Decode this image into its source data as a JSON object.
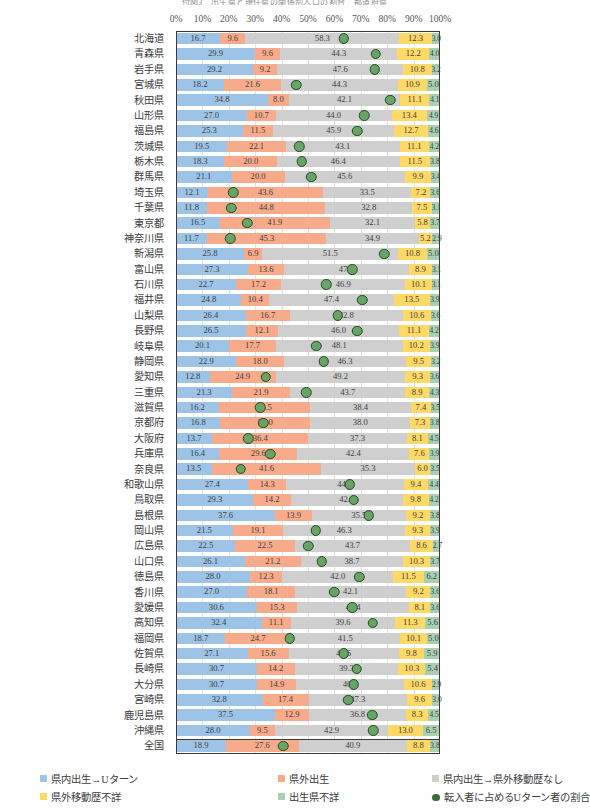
{
  "title": "付図3　出生県と現住県の関係別人口の割合　都道府県",
  "axis": {
    "ticks": [
      "0%",
      "10%",
      "20%",
      "30%",
      "40%",
      "50%",
      "60%",
      "70%",
      "80%",
      "90%",
      "100%"
    ],
    "min": 0,
    "max": 100
  },
  "legend": {
    "items": [
      {
        "label": "県内出生→Uターン",
        "color": "#9dc3e6",
        "marker": "square"
      },
      {
        "label": "県外出生",
        "color": "#f8ab8a",
        "marker": "square"
      },
      {
        "label": "県内出生→県外移動歴なし",
        "color": "#cfcfcf",
        "marker": "square"
      },
      {
        "label": "県外移動歴不詳",
        "color": "#ffd966",
        "marker": "square"
      },
      {
        "label": "出生県不詳",
        "color": "#a9d0b0",
        "marker": "square"
      },
      {
        "label": "転入者に占めるUターン者の割合",
        "color": "#3d6b3d",
        "marker": "circle"
      }
    ]
  },
  "series_colors": {
    "uturn": "#9dc3e6",
    "outside_born": "#f8ab8a",
    "no_move": "#cfcfcf",
    "move_unknown": "#ffd966",
    "birth_unknown": "#a9d0b0",
    "dot": "#6aa368",
    "dot_border": "#1f4d1f"
  },
  "chart_data": {
    "type": "bar",
    "orientation": "horizontal",
    "stacked": true,
    "normalized_percent": true,
    "title": "付図3　出生県と現住県の関係別人口の割合　都道府県",
    "xlabel": "",
    "ylabel": "",
    "xlim": [
      0,
      100
    ],
    "grid": true,
    "legend_position": "bottom",
    "series": [
      {
        "name": "県内出生→Uターン",
        "key": "uturn"
      },
      {
        "name": "県外出生",
        "key": "outside_born"
      },
      {
        "name": "県内出生→県外移動歴なし",
        "key": "no_move"
      },
      {
        "name": "県外移動歴不詳",
        "key": "move_unknown"
      },
      {
        "name": "出生県不詳",
        "key": "birth_unknown"
      }
    ],
    "overlay_series": {
      "name": "転入者に占めるUターン者の割合",
      "key": "dot",
      "unit": "%"
    },
    "categories": [
      "北海道",
      "青森県",
      "岩手県",
      "宮城県",
      "秋田県",
      "山形県",
      "福島県",
      "茨城県",
      "栃木県",
      "群馬県",
      "埼玉県",
      "千葉県",
      "東京都",
      "神奈川県",
      "新潟県",
      "富山県",
      "石川県",
      "福井県",
      "山梨県",
      "長野県",
      "岐阜県",
      "静岡県",
      "愛知県",
      "三重県",
      "滋賀県",
      "京都府",
      "大阪府",
      "兵庫県",
      "奈良県",
      "和歌山県",
      "鳥取県",
      "島根県",
      "岡山県",
      "広島県",
      "山口県",
      "徳島県",
      "香川県",
      "愛媛県",
      "高知県",
      "福岡県",
      "佐賀県",
      "長崎県",
      "大分県",
      "宮崎県",
      "鹿児島県",
      "沖縄県",
      "全国"
    ],
    "rows": [
      {
        "name": "北海道",
        "uturn": 16.7,
        "outside_born": 9.6,
        "no_move": 58.3,
        "move_unknown": 12.3,
        "birth_unknown": 3.0,
        "dot": 63.5
      },
      {
        "name": "青森県",
        "uturn": 29.9,
        "outside_born": 9.6,
        "no_move": 44.3,
        "move_unknown": 12.2,
        "birth_unknown": 4.0,
        "dot": 75.7
      },
      {
        "name": "岩手県",
        "uturn": 29.2,
        "outside_born": 9.2,
        "no_move": 47.6,
        "move_unknown": 10.8,
        "birth_unknown": 3.2,
        "dot": 75.3
      },
      {
        "name": "宮城県",
        "uturn": 18.2,
        "outside_born": 21.6,
        "no_move": 44.3,
        "move_unknown": 10.9,
        "birth_unknown": 5.0,
        "dot": 45.5
      },
      {
        "name": "秋田県",
        "uturn": 34.8,
        "outside_born": 8.0,
        "no_move": 42.1,
        "move_unknown": 11.1,
        "birth_unknown": 4.1,
        "dot": 81.2
      },
      {
        "name": "山形県",
        "uturn": 27.0,
        "outside_born": 10.7,
        "no_move": 44.0,
        "move_unknown": 13.4,
        "birth_unknown": 4.9,
        "dot": 71.4
      },
      {
        "name": "福島県",
        "uturn": 25.3,
        "outside_born": 11.5,
        "no_move": 45.9,
        "move_unknown": 12.7,
        "birth_unknown": 4.6,
        "dot": 68.7
      },
      {
        "name": "茨城県",
        "uturn": 19.5,
        "outside_born": 22.1,
        "no_move": 43.1,
        "move_unknown": 11.1,
        "birth_unknown": 4.2,
        "dot": 46.6
      },
      {
        "name": "栃木県",
        "uturn": 18.3,
        "outside_born": 20.0,
        "no_move": 46.4,
        "move_unknown": 11.5,
        "birth_unknown": 3.8,
        "dot": 47.7
      },
      {
        "name": "群馬県",
        "uturn": 21.1,
        "outside_born": 20.0,
        "no_move": 45.6,
        "move_unknown": 9.9,
        "birth_unknown": 3.4,
        "dot": 51.3
      },
      {
        "name": "埼玉県",
        "uturn": 12.1,
        "outside_born": 43.6,
        "no_move": 33.5,
        "move_unknown": 7.2,
        "birth_unknown": 3.6,
        "dot": 21.7
      },
      {
        "name": "千葉県",
        "uturn": 11.8,
        "outside_born": 44.8,
        "no_move": 32.8,
        "move_unknown": 7.5,
        "birth_unknown": 3.1,
        "dot": 20.9
      },
      {
        "name": "東京都",
        "uturn": 16.5,
        "outside_born": 41.9,
        "no_move": 32.1,
        "move_unknown": 5.8,
        "birth_unknown": 3.7,
        "dot": 26.9
      },
      {
        "name": "神奈川県",
        "uturn": 11.7,
        "outside_born": 45.3,
        "no_move": 34.9,
        "move_unknown": 5.2,
        "birth_unknown": 2.9,
        "dot": 20.5
      },
      {
        "name": "新潟県",
        "uturn": 25.8,
        "outside_born": 6.9,
        "no_move": 51.5,
        "move_unknown": 10.8,
        "birth_unknown": 5.0,
        "dot": 78.9
      },
      {
        "name": "富山県",
        "uturn": 27.3,
        "outside_born": 13.6,
        "no_move": 47.2,
        "move_unknown": 8.9,
        "birth_unknown": 3.1,
        "dot": 66.7
      },
      {
        "name": "石川県",
        "uturn": 22.7,
        "outside_born": 17.2,
        "no_move": 46.9,
        "move_unknown": 10.1,
        "birth_unknown": 3.1,
        "dot": 56.9
      },
      {
        "name": "福井県",
        "uturn": 24.8,
        "outside_born": 10.4,
        "no_move": 47.4,
        "move_unknown": 13.5,
        "birth_unknown": 3.9,
        "dot": 70.5
      },
      {
        "name": "山梨県",
        "uturn": 26.4,
        "outside_born": 16.7,
        "no_move": 42.8,
        "move_unknown": 10.6,
        "birth_unknown": 3.6,
        "dot": 61.3
      },
      {
        "name": "長野県",
        "uturn": 26.5,
        "outside_born": 12.1,
        "no_move": 46.0,
        "move_unknown": 11.1,
        "birth_unknown": 4.2,
        "dot": 68.6
      },
      {
        "name": "岐阜県",
        "uturn": 20.1,
        "outside_born": 17.7,
        "no_move": 48.1,
        "move_unknown": 10.2,
        "birth_unknown": 3.9,
        "dot": 53.2
      },
      {
        "name": "静岡県",
        "uturn": 22.9,
        "outside_born": 18.0,
        "no_move": 46.3,
        "move_unknown": 9.5,
        "birth_unknown": 3.2,
        "dot": 56.0
      },
      {
        "name": "愛知県",
        "uturn": 12.8,
        "outside_born": 24.9,
        "no_move": 49.2,
        "move_unknown": 9.3,
        "birth_unknown": 3.6,
        "dot": 34.0
      },
      {
        "name": "三重県",
        "uturn": 21.3,
        "outside_born": 21.9,
        "no_move": 43.7,
        "move_unknown": 8.9,
        "birth_unknown": 4.3,
        "dot": 49.3
      },
      {
        "name": "滋賀県",
        "uturn": 16.2,
        "outside_born": 34.5,
        "no_move": 38.4,
        "move_unknown": 7.4,
        "birth_unknown": 3.5,
        "dot": 31.9
      },
      {
        "name": "京都府",
        "uturn": 16.8,
        "outside_born": 34.0,
        "no_move": 38.0,
        "move_unknown": 7.3,
        "birth_unknown": 3.8,
        "dot": 33.1
      },
      {
        "name": "大阪府",
        "uturn": 13.7,
        "outside_born": 36.4,
        "no_move": 37.3,
        "move_unknown": 8.1,
        "birth_unknown": 4.5,
        "dot": 27.3
      },
      {
        "name": "兵庫県",
        "uturn": 16.4,
        "outside_born": 29.6,
        "no_move": 42.4,
        "move_unknown": 7.6,
        "birth_unknown": 3.9,
        "dot": 35.7
      },
      {
        "name": "奈良県",
        "uturn": 13.5,
        "outside_born": 41.6,
        "no_move": 35.3,
        "move_unknown": 6.0,
        "birth_unknown": 3.5,
        "dot": 24.5
      },
      {
        "name": "和歌山県",
        "uturn": 27.4,
        "outside_born": 14.3,
        "no_move": 44.5,
        "move_unknown": 9.4,
        "birth_unknown": 4.4,
        "dot": 65.8
      },
      {
        "name": "鳥取県",
        "uturn": 29.3,
        "outside_born": 14.2,
        "no_move": 42.4,
        "move_unknown": 9.8,
        "birth_unknown": 4.2,
        "dot": 67.4
      },
      {
        "name": "島根県",
        "uturn": 37.6,
        "outside_born": 13.9,
        "no_move": 35.5,
        "move_unknown": 9.2,
        "birth_unknown": 3.8,
        "dot": 73.0
      },
      {
        "name": "岡山県",
        "uturn": 21.5,
        "outside_born": 19.1,
        "no_move": 46.3,
        "move_unknown": 9.3,
        "birth_unknown": 3.9,
        "dot": 52.9
      },
      {
        "name": "広島県",
        "uturn": 22.5,
        "outside_born": 22.5,
        "no_move": 43.7,
        "move_unknown": 8.6,
        "birth_unknown": 2.7,
        "dot": 50.0
      },
      {
        "name": "山口県",
        "uturn": 26.1,
        "outside_born": 21.2,
        "no_move": 38.7,
        "move_unknown": 10.3,
        "birth_unknown": 3.7,
        "dot": 55.2
      },
      {
        "name": "徳島県",
        "uturn": 28.0,
        "outside_born": 12.3,
        "no_move": 42.0,
        "move_unknown": 11.5,
        "birth_unknown": 6.2,
        "dot": 69.5
      },
      {
        "name": "香川県",
        "uturn": 27.0,
        "outside_born": 18.1,
        "no_move": 42.1,
        "move_unknown": 9.2,
        "birth_unknown": 3.6,
        "dot": 59.9
      },
      {
        "name": "愛媛県",
        "uturn": 30.6,
        "outside_born": 15.3,
        "no_move": 42.4,
        "move_unknown": 8.1,
        "birth_unknown": 3.6,
        "dot": 66.7
      },
      {
        "name": "高知県",
        "uturn": 32.4,
        "outside_born": 11.1,
        "no_move": 39.6,
        "move_unknown": 11.3,
        "birth_unknown": 5.6,
        "dot": 74.5
      },
      {
        "name": "福岡県",
        "uturn": 18.7,
        "outside_born": 24.7,
        "no_move": 41.5,
        "move_unknown": 10.1,
        "birth_unknown": 5.0,
        "dot": 43.1
      },
      {
        "name": "佐賀県",
        "uturn": 27.1,
        "outside_born": 15.6,
        "no_move": 41.6,
        "move_unknown": 9.8,
        "birth_unknown": 5.9,
        "dot": 63.5
      },
      {
        "name": "長崎県",
        "uturn": 30.7,
        "outside_born": 14.2,
        "no_move": 39.3,
        "move_unknown": 10.3,
        "birth_unknown": 5.4,
        "dot": 68.4
      },
      {
        "name": "大分県",
        "uturn": 30.7,
        "outside_born": 14.9,
        "no_move": 40.8,
        "move_unknown": 10.6,
        "birth_unknown": 2.9,
        "dot": 67.3
      },
      {
        "name": "宮崎県",
        "uturn": 32.8,
        "outside_born": 17.4,
        "no_move": 37.3,
        "move_unknown": 9.6,
        "birth_unknown": 3.0,
        "dot": 65.3
      },
      {
        "name": "鹿児島県",
        "uturn": 37.5,
        "outside_born": 12.9,
        "no_move": 36.8,
        "move_unknown": 8.3,
        "birth_unknown": 4.5,
        "dot": 74.4
      },
      {
        "name": "沖縄県",
        "uturn": 28.0,
        "outside_born": 9.5,
        "no_move": 42.9,
        "move_unknown": 13.0,
        "birth_unknown": 6.5,
        "dot": 74.7
      },
      {
        "name": "全国",
        "uturn": 18.9,
        "outside_born": 27.6,
        "no_move": 40.9,
        "move_unknown": 8.8,
        "birth_unknown": 3.8,
        "dot": 40.6
      }
    ]
  }
}
